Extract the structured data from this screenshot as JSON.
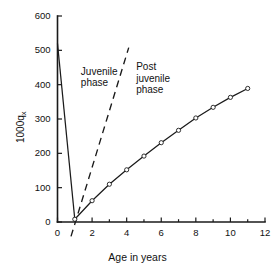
{
  "figure": {
    "background": "#ffffff",
    "ink_color": "#1a1a1a"
  },
  "annotations": {
    "juvenile": "Juvenile\nphase",
    "post_juvenile": "Post\njuvenile\nphase"
  },
  "chart_data": {
    "type": "line",
    "title": "",
    "subtitle": "",
    "xlabel": "Age in years",
    "ylabel": "1000q",
    "ylabel_subscript": "x",
    "xlim": [
      0,
      12
    ],
    "ylim": [
      0,
      600
    ],
    "xticks": [
      0,
      2,
      4,
      6,
      8,
      10,
      12
    ],
    "xticklabels": [
      "0",
      "2",
      "4",
      "6",
      "8",
      "10",
      "12"
    ],
    "yticks": [
      0,
      100,
      200,
      300,
      400,
      500,
      600
    ],
    "yticklabels": [
      "0",
      "100",
      "200",
      "300",
      "400",
      "500",
      "600"
    ],
    "xminorticks": [
      1,
      3,
      5,
      7,
      9,
      11
    ],
    "grid": false,
    "legend": false,
    "legend_position": "none",
    "series": [
      {
        "name": "Juvenile phase mortality",
        "style": "solid",
        "markers": false,
        "x": [
          0,
          1
        ],
        "y": [
          520,
          8
        ]
      },
      {
        "name": "Post juvenile phase mortality",
        "style": "solid",
        "markers": true,
        "marker_shape": "open-circle",
        "x": [
          1,
          2,
          3,
          4,
          5,
          6,
          7,
          8,
          9,
          10,
          11
        ],
        "y": [
          8,
          62,
          110,
          152,
          192,
          231,
          267,
          303,
          334,
          363,
          389
        ]
      },
      {
        "name": "Reference slope (dashed)",
        "style": "dashed",
        "markers": false,
        "x": [
          0.78,
          4.12
        ],
        "y": [
          -42,
          508
        ]
      }
    ],
    "annotations": [
      {
        "text": "Juvenile phase",
        "x": 1.6,
        "y": 430
      },
      {
        "text": "Post juvenile phase",
        "x": 4.8,
        "y": 440
      }
    ]
  }
}
